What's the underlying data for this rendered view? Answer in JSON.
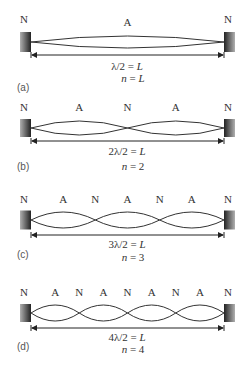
{
  "figure": {
    "panels": [
      {
        "tag": "(a)",
        "n": 1,
        "node_labels": [
          "N",
          "N"
        ],
        "antinode_labels": [
          "A"
        ],
        "equation": "λ/2 = L",
        "n_label": "n = L"
      },
      {
        "tag": "(b)",
        "n": 2,
        "node_labels": [
          "N",
          "N",
          "N"
        ],
        "antinode_labels": [
          "A",
          "A"
        ],
        "equation": "2λ/2 = L",
        "n_label": "n = 2"
      },
      {
        "tag": "(c)",
        "n": 3,
        "node_labels": [
          "N",
          "N",
          "N",
          "N"
        ],
        "antinode_labels": [
          "A",
          "A",
          "A"
        ],
        "equation": "3λ/2 = L",
        "n_label": "n = 3"
      },
      {
        "tag": "(d)",
        "n": 4,
        "node_labels": [
          "N",
          "N",
          "N",
          "N",
          "N"
        ],
        "antinode_labels": [
          "A",
          "A",
          "A",
          "A"
        ],
        "equation": "4λ/2 = L",
        "n_label": "n = 4"
      }
    ],
    "colors": {
      "string": "#333333",
      "clamp_dark": "#2a2a2a",
      "clamp_light": "#9a9a9a",
      "text": "#333333"
    }
  }
}
